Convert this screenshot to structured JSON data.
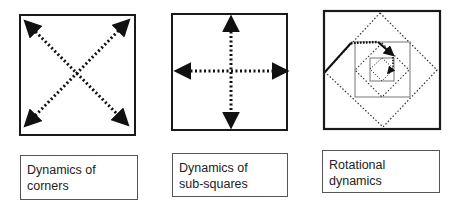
{
  "panels": [
    {
      "id": "corners",
      "label_lines": [
        "Dynamics of",
        "corners"
      ],
      "arrows": "diagonal"
    },
    {
      "id": "sub-squares",
      "label_lines": [
        "Dynamics of",
        "sub-squares"
      ],
      "arrows": "cross"
    },
    {
      "id": "rotational",
      "label_lines": [
        "Rotational",
        "dynamics"
      ],
      "arrows": "spiral"
    }
  ],
  "colors": {
    "frame": "#1a1a1a",
    "arrow": "#111111",
    "inner_square": "#666666",
    "label_border": "#555555"
  }
}
